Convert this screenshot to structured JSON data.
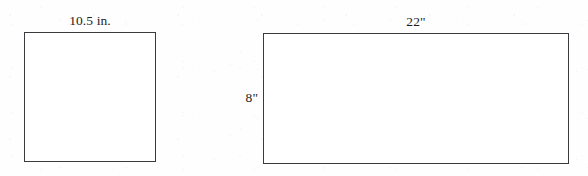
{
  "figure": {
    "caption": "",
    "background_color": "#ffffff",
    "stroke_color": "#3b3b3f",
    "fill_color": "#ffffff",
    "text_color": "#1d1d1d",
    "shapes": [
      {
        "name": "square",
        "kind": "square",
        "labels": {
          "top": "10.5 in."
        }
      },
      {
        "name": "rectangle",
        "kind": "rectangle",
        "labels": {
          "top": "22\"",
          "left": "8\""
        }
      }
    ]
  }
}
